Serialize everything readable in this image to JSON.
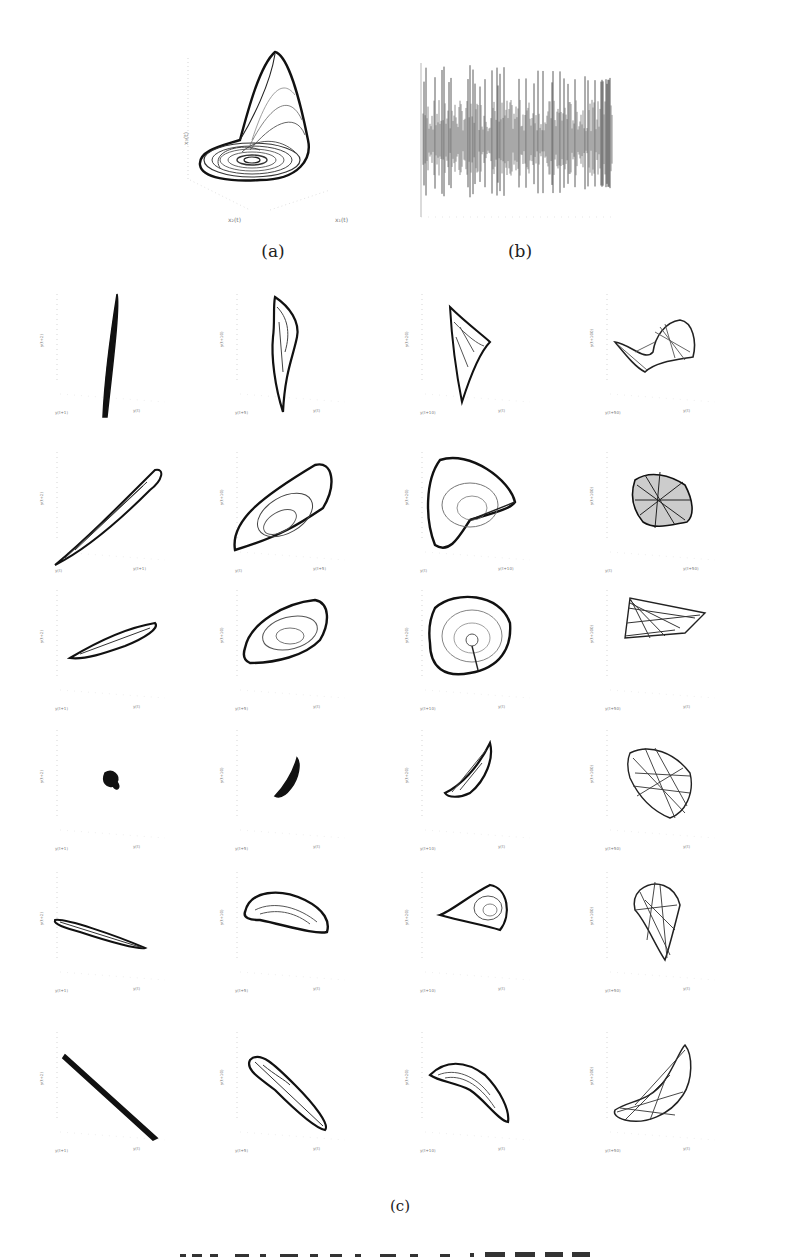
{
  "figure": {
    "panel_a": {
      "label": "(a)",
      "type": "3d-attractor",
      "xlabel": "x₂(t)",
      "ylabel": "x₁(t)",
      "zlabel": "x₃(t)"
    },
    "panel_b": {
      "label": "(b)",
      "type": "time-series"
    },
    "panel_c": {
      "label": "(c)",
      "type": "grid-of-3d-phase-reconstructions",
      "rows": 6,
      "cols": 4
    },
    "caption_partial": "… 形态模式例"
  },
  "chart_data": [
    {
      "type": "scatter",
      "title": "(a)",
      "description": "3D chaotic attractor (Rössler-like) trajectory",
      "xlabel": "x₂(t)",
      "ylabel": "x₁(t)",
      "zlabel": "x₃(t)",
      "z_ticks": [
        "0",
        "1",
        "2",
        "3",
        "4",
        "5",
        "6",
        "7",
        "8"
      ],
      "x_ticks": [
        "0",
        "5",
        "10"
      ],
      "y_ticks": [
        "0",
        "5",
        "10"
      ]
    },
    {
      "type": "line",
      "title": "(b)",
      "description": "Chaotic oscillation time series, dense spikes",
      "xlabel": "",
      "ylabel": "",
      "x_ticks": [
        "0",
        "50",
        "100",
        "150",
        "200",
        "250",
        "300",
        "350",
        "400",
        "450",
        "500"
      ],
      "grid": false
    },
    {
      "type": "scatter",
      "title": "(c)",
      "description": "Delay-embedding phase portraits, axes y(t), y(t+τ), y(t+2τ) for increasing delays",
      "cells": [
        {
          "row": 1,
          "col": 1,
          "xlabel": "y(t+1)",
          "zlabel": "y(t)",
          "ylabel": "y(t+2)",
          "shape": "thin-needle"
        },
        {
          "row": 1,
          "col": 2,
          "xlabel": "y(t+5)",
          "zlabel": "y(t)",
          "ylabel": "y(t+10)",
          "shape": "tall-loop"
        },
        {
          "row": 1,
          "col": 3,
          "xlabel": "y(t+10)",
          "zlabel": "y(t)",
          "ylabel": "y(t+20)",
          "shape": "triangle-loop"
        },
        {
          "row": 1,
          "col": 4,
          "xlabel": "y(t+50)",
          "zlabel": "y(t)",
          "ylabel": "y(t+100)",
          "shape": "folded-tangle"
        },
        {
          "row": 2,
          "col": 1,
          "xlabel": "y(t)",
          "zlabel": "y(t+1)",
          "ylabel": "y(t+2)",
          "shape": "diagonal-ellipse"
        },
        {
          "row": 2,
          "col": 2,
          "xlabel": "y(t)",
          "zlabel": "y(t+5)",
          "ylabel": "y(t+10)",
          "shape": "spiral-wedge"
        },
        {
          "row": 2,
          "col": 3,
          "xlabel": "y(t)",
          "zlabel": "y(t+10)",
          "ylabel": "y(t+20)",
          "shape": "spiral-triangle"
        },
        {
          "row": 2,
          "col": 4,
          "xlabel": "y(t)",
          "zlabel": "y(t+50)",
          "ylabel": "y(t+100)",
          "shape": "dense-tangle"
        },
        {
          "row": 3,
          "col": 1,
          "xlabel": "y(t+1)",
          "zlabel": "y(t)",
          "ylabel": "y(t+2)",
          "shape": "slanted-ellipse"
        },
        {
          "row": 3,
          "col": 2,
          "xlabel": "y(t+5)",
          "zlabel": "y(t)",
          "ylabel": "y(t+10)",
          "shape": "spiral-blob"
        },
        {
          "row": 3,
          "col": 3,
          "xlabel": "y(t+10)",
          "zlabel": "y(t)",
          "ylabel": "y(t+20)",
          "shape": "round-spiral"
        },
        {
          "row": 3,
          "col": 4,
          "xlabel": "y(t+50)",
          "zlabel": "y(t)",
          "ylabel": "y(t+100)",
          "shape": "triangular-fan"
        },
        {
          "row": 4,
          "col": 1,
          "xlabel": "y(t+1)",
          "zlabel": "y(t)",
          "ylabel": "y(t+2)",
          "shape": "small-blob"
        },
        {
          "row": 4,
          "col": 2,
          "xlabel": "y(t+5)",
          "zlabel": "y(t)",
          "ylabel": "y(t+10)",
          "shape": "small-wedge"
        },
        {
          "row": 4,
          "col": 3,
          "xlabel": "y(t+10)",
          "zlabel": "y(t)",
          "ylabel": "y(t+20)",
          "shape": "hook"
        },
        {
          "row": 4,
          "col": 4,
          "xlabel": "y(t+50)",
          "zlabel": "y(t)",
          "ylabel": "y(t+100)",
          "shape": "crossed-tangle"
        },
        {
          "row": 5,
          "col": 1,
          "xlabel": "y(t+1)",
          "zlabel": "y(t)",
          "ylabel": "y(t+2)",
          "shape": "descending-needle"
        },
        {
          "row": 5,
          "col": 2,
          "xlabel": "y(t+5)",
          "zlabel": "y(t)",
          "ylabel": "y(t+10)",
          "shape": "bean-spiral"
        },
        {
          "row": 5,
          "col": 3,
          "xlabel": "y(t+10)",
          "zlabel": "y(t)",
          "ylabel": "y(t+20)",
          "shape": "fan-spiral"
        },
        {
          "row": 5,
          "col": 4,
          "xlabel": "y(t+50)",
          "zlabel": "y(t)",
          "ylabel": "y(t+100)",
          "shape": "vertical-tangle"
        },
        {
          "row": 6,
          "col": 1,
          "xlabel": "y(t+1)",
          "zlabel": "y(t)",
          "ylabel": "y(t+2)",
          "shape": "straight-diagonal"
        },
        {
          "row": 6,
          "col": 2,
          "xlabel": "y(t+5)",
          "zlabel": "y(t)",
          "ylabel": "y(t+10)",
          "shape": "narrow-diagonal-loop"
        },
        {
          "row": 6,
          "col": 3,
          "xlabel": "y(t+10)",
          "zlabel": "y(t)",
          "ylabel": "y(t+20)",
          "shape": "banana"
        },
        {
          "row": 6,
          "col": 4,
          "xlabel": "y(t+50)",
          "zlabel": "y(t)",
          "ylabel": "y(t+100)",
          "shape": "bowtie-tangle"
        }
      ]
    }
  ]
}
